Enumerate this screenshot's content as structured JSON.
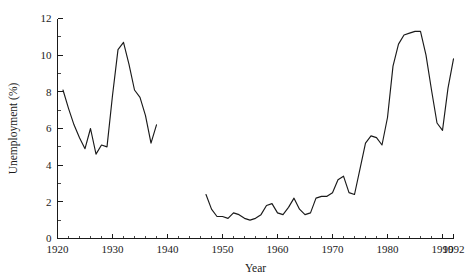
{
  "chart_data": {
    "type": "line",
    "title": "",
    "xlabel": "Year",
    "ylabel": "Unemployment (%)",
    "xlim": [
      1920,
      1992
    ],
    "ylim": [
      0,
      12
    ],
    "grid": false,
    "legend": null,
    "x_ticks": [
      1920,
      1930,
      1940,
      1950,
      1960,
      1970,
      1980,
      1990,
      1992
    ],
    "x_tick_labels": [
      "1920",
      "1930",
      "1940",
      "1950",
      "1960",
      "1970",
      "1980",
      "1990",
      "1992"
    ],
    "x_minor_step": 2,
    "y_ticks": [
      0,
      2,
      4,
      6,
      8,
      10,
      12
    ],
    "y_tick_labels": [
      "0",
      "2",
      "4",
      "6",
      "8",
      "10",
      "12"
    ],
    "y_minor_step": 1,
    "line_color": "#1a1a1a",
    "series": [
      {
        "name": "Unemployment interwar",
        "x": [
          1921,
          1922,
          1923,
          1924,
          1925,
          1926,
          1927,
          1928,
          1929,
          1930,
          1931,
          1932,
          1933,
          1934,
          1935,
          1936,
          1937,
          1938
        ],
        "values": [
          8.1,
          7.1,
          6.2,
          5.5,
          4.9,
          6.0,
          4.6,
          5.1,
          5.0,
          7.8,
          10.3,
          10.7,
          9.5,
          8.1,
          7.7,
          6.7,
          5.2,
          6.2
        ]
      },
      {
        "name": "Unemployment postwar",
        "x": [
          1947,
          1948,
          1949,
          1950,
          1951,
          1952,
          1953,
          1954,
          1955,
          1956,
          1957,
          1958,
          1959,
          1960,
          1961,
          1962,
          1963,
          1964,
          1965,
          1966,
          1967,
          1968,
          1969,
          1970,
          1971,
          1972,
          1973,
          1974,
          1975,
          1976,
          1977,
          1978,
          1979,
          1980,
          1981,
          1982,
          1983,
          1984,
          1985,
          1986,
          1987,
          1988,
          1989,
          1990,
          1991,
          1992
        ],
        "values": [
          2.4,
          1.6,
          1.2,
          1.2,
          1.1,
          1.4,
          1.3,
          1.1,
          1.0,
          1.1,
          1.3,
          1.8,
          1.9,
          1.4,
          1.3,
          1.7,
          2.2,
          1.6,
          1.3,
          1.4,
          2.2,
          2.3,
          2.3,
          2.5,
          3.2,
          3.4,
          2.5,
          2.4,
          3.8,
          5.2,
          5.6,
          5.5,
          5.1,
          6.6,
          9.4,
          10.6,
          11.1,
          11.2,
          11.3,
          11.3,
          10.0,
          8.1,
          6.3,
          5.9,
          8.2,
          9.8
        ]
      }
    ]
  }
}
